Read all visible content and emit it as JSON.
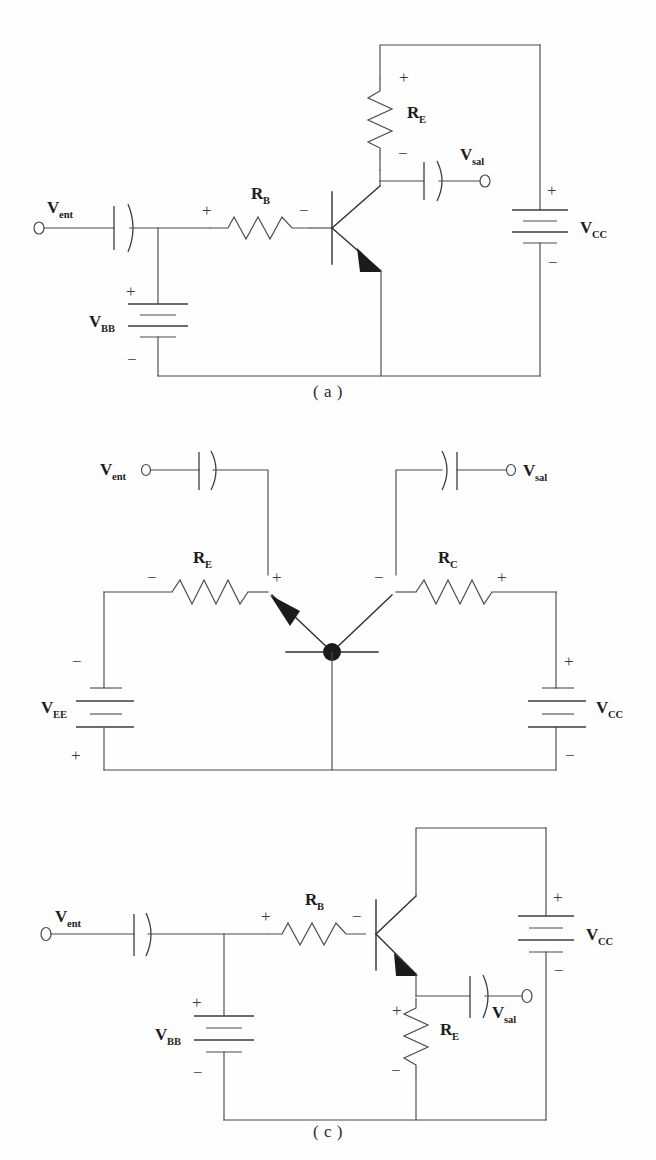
{
  "document": {
    "type": "circuit-diagram-figure",
    "title": "Transistor amplifier configurations",
    "panel_count": 3
  },
  "figures": [
    {
      "id": "a",
      "caption": "( a )",
      "configuration": "common-emitter",
      "labels": {
        "input_source": "V",
        "input_source_sub": "ent",
        "output_terminal": "V",
        "output_terminal_sub": "sal",
        "base_resistor": "R",
        "base_resistor_sub": "B",
        "collector_resistor": "R",
        "collector_resistor_sub": "E",
        "base_supply": "V",
        "base_supply_sub": "BB",
        "collector_supply": "V",
        "collector_supply_sub": "CC"
      },
      "polarity": {
        "rb_left": "+",
        "rb_right": "−",
        "re_top": "+",
        "re_bottom": "−",
        "vbb_top": "+",
        "vbb_bottom": "−",
        "vcc_top": "+",
        "vcc_bottom": "−"
      }
    },
    {
      "id": "b",
      "caption": "( b )",
      "configuration": "common-base",
      "labels": {
        "input_source": "V",
        "input_source_sub": "ent",
        "output_terminal": "V",
        "output_terminal_sub": "sal",
        "emitter_resistor": "R",
        "emitter_resistor_sub": "E",
        "collector_resistor": "R",
        "collector_resistor_sub": "C",
        "emitter_supply": "V",
        "emitter_supply_sub": "EE",
        "collector_supply": "V",
        "collector_supply_sub": "CC"
      },
      "polarity": {
        "re_left": "−",
        "re_right": "+",
        "rc_left": "−",
        "rc_right": "+",
        "vee_top": "−",
        "vee_bottom": "+",
        "vcc_top": "+",
        "vcc_bottom": "−"
      }
    },
    {
      "id": "c",
      "caption": "( c )",
      "configuration": "common-collector",
      "labels": {
        "input_source": "V",
        "input_source_sub": "ent",
        "output_terminal": "V",
        "output_terminal_sub": "sal",
        "base_resistor": "R",
        "base_resistor_sub": "B",
        "emitter_resistor": "R",
        "emitter_resistor_sub": "E",
        "base_supply": "V",
        "base_supply_sub": "BB",
        "collector_supply": "V",
        "collector_supply_sub": "CC"
      },
      "polarity": {
        "rb_left": "+",
        "rb_right": "−",
        "re_top": "+",
        "re_bottom": "−",
        "vbb_top": "+",
        "vbb_bottom": "−",
        "vcc_top": "+",
        "vcc_bottom": "−"
      }
    }
  ],
  "colors": {
    "background": "#fefefe",
    "wire": "#4a4a4a",
    "text": "#1d1d1d",
    "solid_fill": "#1b1b1b"
  }
}
